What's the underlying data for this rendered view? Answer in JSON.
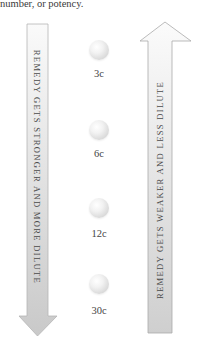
{
  "intro_text": "number, or potency.",
  "arrows": {
    "down": {
      "label": "REMEDY GETS STRONGER AND MORE DILUTE",
      "fill": "#d7d7d7"
    },
    "up": {
      "label": "REMEDY GETS WEAKER AND LESS DILUTE",
      "fill": "#d7d7d7"
    }
  },
  "potencies": [
    {
      "label": "3c"
    },
    {
      "label": "6c"
    },
    {
      "label": "12c"
    },
    {
      "label": "30c"
    }
  ]
}
